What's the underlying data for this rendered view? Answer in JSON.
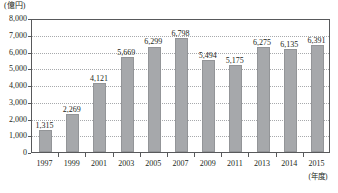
{
  "chart_data": {
    "type": "bar",
    "title": "",
    "subtitle": "",
    "xlabel": "(年度)",
    "ylabel": "(億円)",
    "unit_label": "(億円)",
    "axis_note": "(年度)",
    "categories": [
      "1997",
      "1999",
      "2001",
      "2003",
      "2005",
      "2007",
      "2009",
      "2011",
      "2013",
      "2014",
      "2015"
    ],
    "values": [
      1315,
      2269,
      4121,
      5669,
      6299,
      6798,
      5494,
      5175,
      6275,
      6135,
      6391
    ],
    "value_labels": [
      "1,315",
      "2,269",
      "4,121",
      "5,669",
      "6,299",
      "6,798",
      "5,494",
      "5,175",
      "6,275",
      "6,135",
      "6,391"
    ],
    "ylim": [
      0,
      8000
    ],
    "ytick_values": [
      8000,
      7000,
      6000,
      5000,
      4000,
      3000,
      2000,
      1000,
      0
    ],
    "ytick_labels": [
      "8,000",
      "7,000",
      "6,000",
      "5,000",
      "4,000",
      "3,000",
      "2,000",
      "1,000",
      "0"
    ],
    "grid": true,
    "grid_style": "dotted-horizontal",
    "legend": [],
    "legend_position": "none",
    "bar_color": "#a6a8ab",
    "bar_border_color": "#939598",
    "axis_color": "#58595b",
    "grid_color": "#a7a9ab",
    "text_color": "#231f20"
  }
}
